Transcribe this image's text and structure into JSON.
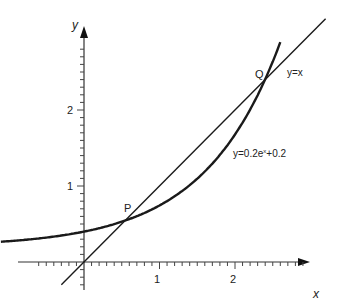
{
  "chart_data": {
    "type": "line",
    "title": "",
    "xlabel": "x",
    "ylabel": "y",
    "x_ticks": [
      "1",
      "2"
    ],
    "y_ticks": [
      "1",
      "2"
    ],
    "xlim": [
      -0.35,
      2.9
    ],
    "ylim": [
      -0.35,
      2.85
    ],
    "grid": false,
    "series": [
      {
        "name": "y=x",
        "type": "line",
        "expression": "y = x",
        "x": [
          -0.3,
          3.2
        ],
        "y": [
          -0.3,
          3.2
        ]
      },
      {
        "name": "y=0.2e^x+0.2",
        "type": "curve",
        "expression": "y = 0.2e^x + 0.2",
        "x": [
          -1.1,
          -0.5,
          0,
          0.5,
          1,
          1.5,
          2,
          2.4,
          2.6
        ],
        "y": [
          0.267,
          0.321,
          0.4,
          0.53,
          0.744,
          1.096,
          1.678,
          2.404,
          2.893
        ]
      }
    ],
    "annotations": [
      {
        "label": "P",
        "x": 0.58,
        "y": 0.58
      },
      {
        "label": "Q",
        "x": 2.4,
        "y": 2.4
      }
    ]
  },
  "labels": {
    "y_axis": "y",
    "x_axis": "x",
    "tick_x1": "1",
    "tick_x2": "2",
    "tick_y1": "1",
    "tick_y2": "2",
    "point_p": "P",
    "point_q": "Q",
    "line_label": "y=x",
    "curve_label_prefix": "y=0.2e",
    "curve_label_sup": "x",
    "curve_label_suffix": "+0.2"
  }
}
